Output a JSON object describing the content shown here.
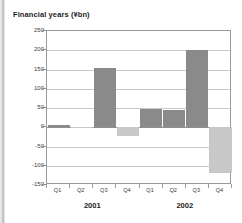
{
  "chart_data": {
    "type": "bar",
    "title": "Financial years (¥bn)",
    "xlabel": "",
    "ylabel": "",
    "ylim": [
      -150,
      250
    ],
    "ytick_step": 50,
    "yticks": [
      250,
      200,
      150,
      100,
      50,
      0,
      -50,
      -100,
      -150
    ],
    "grid": true,
    "legend": "none",
    "categories": [
      "Q1",
      "Q2",
      "Q3",
      "Q4",
      "Q1",
      "Q2",
      "Q3",
      "Q4"
    ],
    "groups": [
      {
        "label": "2001",
        "categories": [
          "Q1",
          "Q2",
          "Q3",
          "Q4"
        ],
        "values": [
          5,
          -3,
          155,
          -22
        ]
      },
      {
        "label": "2002",
        "categories": [
          "Q1",
          "Q2",
          "Q3",
          "Q4"
        ],
        "values": [
          48,
          45,
          200,
          -120
        ]
      }
    ],
    "values": [
      5,
      -3,
      155,
      -22,
      48,
      45,
      200,
      -120
    ],
    "colors": {
      "positive": "#8a8a8a",
      "negative": "#c8c8c8",
      "grid": "#c9c9c9",
      "axis": "#9a9a9a",
      "text": "#1d1d1d",
      "background": "#ffffff"
    }
  }
}
